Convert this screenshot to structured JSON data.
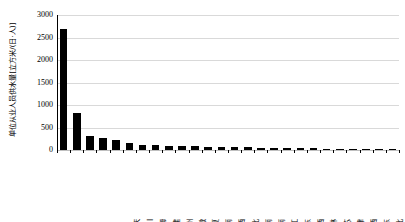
{
  "chart_data": {
    "type": "bar",
    "title": "",
    "subtitle": "",
    "xlabel": "",
    "ylabel": "单位从业人员供水量[立方米/(日·人)]",
    "ylim": [
      0,
      3000
    ],
    "yticks": [
      3000,
      2500,
      2000,
      1500,
      1000,
      500,
      0
    ],
    "ytick_labels": [
      "3000",
      "2500",
      "2000",
      "1500",
      "1000",
      "500",
      "0"
    ],
    "grid": true,
    "legend": "none",
    "bar_color": "#000000",
    "grid_color": "#d9d9d9",
    "axis_color": "#000000",
    "categories": [
      "重庆",
      "四川",
      "上海",
      "福建",
      "贵州",
      "安徽",
      "宁夏",
      "海南",
      "陕西",
      "湖北",
      "云南",
      "河南",
      "黑龙江",
      "山东",
      "山西",
      "吉林",
      "江苏",
      "天津",
      "江西",
      "广东",
      "河北",
      "浙江",
      "内蒙古",
      "辽宁",
      "广西",
      "北京"
    ],
    "values": [
      2680,
      820,
      310,
      275,
      215,
      150,
      120,
      105,
      95,
      88,
      80,
      74,
      68,
      62,
      57,
      52,
      47,
      43,
      39,
      35,
      31,
      27,
      23,
      19,
      15,
      12
    ]
  }
}
